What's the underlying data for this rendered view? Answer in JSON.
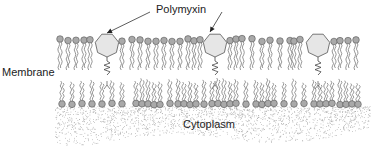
{
  "labels": {
    "polymyxin": "Polymyxin",
    "membrane": "Membrane",
    "cytoplasm": "Cytoplasm"
  },
  "colors": {
    "head_fill": "#a9a9a9",
    "head_stroke": "#555555",
    "tail_stroke": "#6a6a6a",
    "polymyxin_fill": "#e6e6e6",
    "polymyxin_stroke": "#555555",
    "stipple": "#9a9a9a",
    "text": "#222222"
  },
  "diagram": {
    "outer_leaflet": {
      "head_y": 40,
      "tail_bottom_y": 70,
      "head_x": [
        60,
        68,
        76,
        84,
        90,
        122,
        132,
        140,
        148,
        156,
        164,
        172,
        180,
        188,
        194,
        200,
        230,
        236,
        242,
        252,
        262,
        270,
        280,
        290,
        294,
        300,
        334,
        340,
        348,
        356
      ]
    },
    "inner_leaflet": {
      "head_y": 104,
      "tail_top_y": 78,
      "head_x": [
        62,
        72,
        82,
        92,
        102,
        112,
        122,
        136,
        142,
        148,
        154,
        160,
        170,
        178,
        184,
        190,
        196,
        204,
        212,
        218,
        224,
        230,
        236,
        246,
        256,
        262,
        268,
        274,
        284,
        294,
        304,
        314,
        320,
        326,
        332,
        340,
        346,
        352,
        358
      ]
    },
    "polymyxin_molecules": [
      {
        "cx": 107,
        "cy": 45,
        "r": 12
      },
      {
        "cx": 215,
        "cy": 45,
        "r": 12
      },
      {
        "cx": 318,
        "cy": 45,
        "r": 12
      }
    ],
    "arrows": [
      {
        "from": [
          150,
          12
        ],
        "to": [
          107,
          33
        ]
      },
      {
        "from": [
          222,
          12
        ],
        "to": [
          210,
          32
        ]
      }
    ],
    "cytoplasm_region": {
      "top_y": 106,
      "bottom_y": 148
    }
  }
}
